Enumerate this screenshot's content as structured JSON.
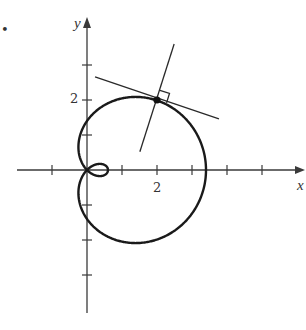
{
  "figure": {
    "type": "polar-curve-with-tangent-and-normal",
    "axes": {
      "x_label": "x",
      "y_label": "y",
      "x_tick_label": "2",
      "y_tick_label": "2",
      "x_ticks": [
        -1,
        1,
        2,
        3,
        4,
        5
      ],
      "y_ticks": [
        -3,
        -2,
        -1,
        1,
        2,
        3
      ],
      "x_range": [
        -2,
        6.2
      ],
      "y_range": [
        -4.1,
        4.4
      ]
    },
    "curve": {
      "description": "limacon with inner loop, r = a + b cos(theta)",
      "a": 1.4,
      "b": 2
    },
    "point": {
      "x": 2,
      "y": 2
    },
    "tangent_line": {
      "from": [
        0.23,
        2.66
      ],
      "to": [
        3.77,
        1.46
      ]
    },
    "normal_line": {
      "from": [
        2.49,
        3.6
      ],
      "to": [
        1.51,
        0.52
      ]
    },
    "right_angle_marker": true,
    "bullet": "•"
  },
  "colors": {
    "curve": "#1a1a1a",
    "axes": "#3a3a3a",
    "background": "#ffffff"
  }
}
